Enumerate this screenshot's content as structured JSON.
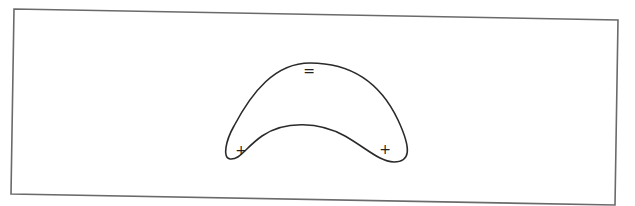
{
  "figure": {
    "labels": {
      "top_sign": "=",
      "left_sign": "+",
      "right_sign": "+"
    },
    "colors": {
      "stroke": "#2a2a2a",
      "frame": "#6a6a6a",
      "background": "#ffffff"
    }
  }
}
